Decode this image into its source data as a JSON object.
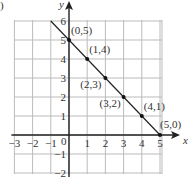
{
  "figure_label": ")",
  "axes": {
    "x_label": "x",
    "y_label": "y",
    "origin_label": "0"
  },
  "x_ticks": [
    "−3",
    "−2",
    "−1",
    "1",
    "2",
    "3",
    "4",
    "5"
  ],
  "x_tick_values": [
    -3,
    -2,
    -1,
    1,
    2,
    3,
    4,
    5
  ],
  "y_ticks": [
    "6",
    "5",
    "4",
    "3",
    "2",
    "1",
    "−1",
    "−2"
  ],
  "y_tick_values": [
    6,
    5,
    4,
    3,
    2,
    1,
    -1,
    -2
  ],
  "chart_data": {
    "type": "line",
    "title": "",
    "xlabel": "x",
    "ylabel": "y",
    "xlim": [
      -3,
      5
    ],
    "ylim": [
      -2,
      6
    ],
    "grid": true,
    "series": [
      {
        "name": "x + y = 5",
        "x": [
          -1,
          5
        ],
        "y": [
          6,
          0
        ]
      }
    ],
    "points": [
      {
        "x": 0,
        "y": 5,
        "label": "(0,5)"
      },
      {
        "x": 1,
        "y": 4,
        "label": "(1,4)"
      },
      {
        "x": 2,
        "y": 3,
        "label": "(2,3)"
      },
      {
        "x": 3,
        "y": 2,
        "label": "(3,2)"
      },
      {
        "x": 4,
        "y": 1,
        "label": "(4,1)"
      },
      {
        "x": 5,
        "y": 0,
        "label": "(5,0)"
      }
    ]
  }
}
